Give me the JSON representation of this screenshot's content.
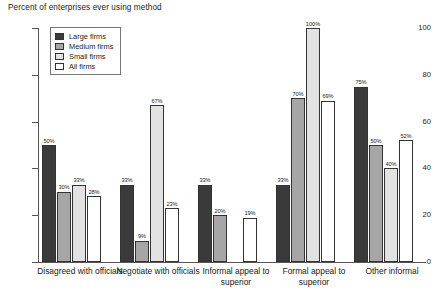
{
  "chart_data": {
    "type": "bar",
    "title": "Percent of enterprises ever using method",
    "xlabel": "",
    "ylabel": "",
    "ylim": [
      0,
      100
    ],
    "yticks": [
      0,
      20,
      40,
      60,
      80,
      100
    ],
    "grid": false,
    "legend_position": "upper-left",
    "categories": [
      "Disagreed with officials",
      "Negotiate with officials",
      "Informal appeal to superior",
      "Formal appeal to superior",
      "Other informal"
    ],
    "series": [
      {
        "name": "Large firms",
        "values": [
          50,
          33,
          33,
          33,
          75
        ]
      },
      {
        "name": "Medium firms",
        "values": [
          30,
          9,
          20,
          70,
          50
        ]
      },
      {
        "name": "Small firms",
        "values": [
          33,
          67,
          null,
          100,
          40
        ]
      },
      {
        "name": "All firms",
        "values": [
          28,
          23,
          19,
          69,
          52
        ]
      }
    ],
    "value_labels": [
      [
        "50%",
        "30%",
        "33%",
        "28%"
      ],
      [
        "33%",
        "9%",
        "67%",
        "23%"
      ],
      [
        "33%",
        "20%",
        "",
        "19%"
      ],
      [
        "33%",
        "70%",
        "100%",
        "69%"
      ],
      [
        "75%",
        "50%",
        "40%",
        "52%"
      ]
    ]
  },
  "legend": {
    "items": [
      {
        "label": "Large firms",
        "key": "large"
      },
      {
        "label": "Medium firms",
        "key": "medium"
      },
      {
        "label": "Small firms",
        "key": "small"
      },
      {
        "label": "All firms",
        "key": "all"
      }
    ]
  },
  "colors": {
    "large": "#3a3a3a",
    "medium": "#a6a6a6",
    "small": "#e2e2e2",
    "all": "#ffffff",
    "outline": "#333333",
    "axis": "#555555"
  }
}
